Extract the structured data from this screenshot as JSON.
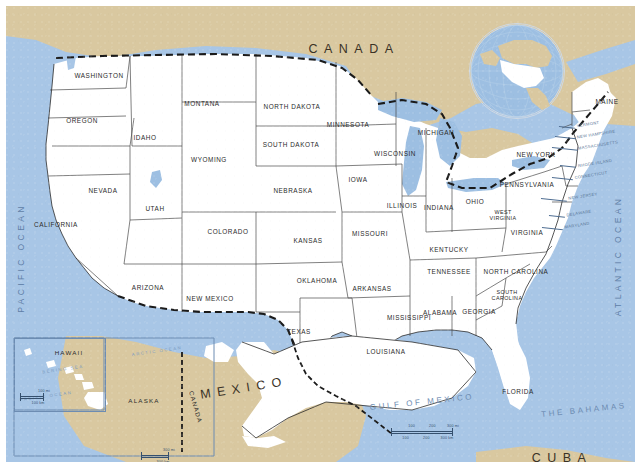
{
  "map": {
    "title": "United States of America reference map",
    "projection_note": "conterminous US with Alaska and Hawaii insets",
    "colors": {
      "ocean": "#a8c6e6",
      "foreign_land": "#d9c8a0",
      "us_land": "#ffffff",
      "state_border": "#4a4a4a",
      "international_border": "#1a1a1a",
      "lake": "#9dbfe2",
      "label": "#2a2a2a",
      "water_label": "#5f7ea6"
    }
  },
  "countries": [
    {
      "name": "CANADA",
      "x": 348,
      "y": 43
    },
    {
      "name": "MEXICO",
      "x": 238,
      "y": 382
    },
    {
      "name": "CUBA",
      "x": 556,
      "y": 452
    }
  ],
  "water_labels": [
    {
      "name": "PACIFIC OCEAN",
      "x": 15,
      "y": 252,
      "rotate": -90
    },
    {
      "name": "ATLANTIC OCEAN",
      "x": 612,
      "y": 250,
      "rotate": -90
    },
    {
      "name": "GULF OF MEXICO",
      "x": 416,
      "y": 396
    },
    {
      "name": "THE BAHAMAS",
      "x": 578,
      "y": 404
    }
  ],
  "states": [
    {
      "name": "WASHINGTON",
      "x": 93,
      "y": 69
    },
    {
      "name": "OREGON",
      "x": 76,
      "y": 114
    },
    {
      "name": "IDAHO",
      "x": 139,
      "y": 131
    },
    {
      "name": "MONTANA",
      "x": 196,
      "y": 97
    },
    {
      "name": "WYOMING",
      "x": 203,
      "y": 153
    },
    {
      "name": "NORTH DAKOTA",
      "x": 286,
      "y": 100
    },
    {
      "name": "SOUTH DAKOTA",
      "x": 285,
      "y": 138
    },
    {
      "name": "NEBRASKA",
      "x": 287,
      "y": 184
    },
    {
      "name": "KANSAS",
      "x": 302,
      "y": 234
    },
    {
      "name": "NEVADA",
      "x": 97,
      "y": 184
    },
    {
      "name": "UTAH",
      "x": 149,
      "y": 202
    },
    {
      "name": "COLORADO",
      "x": 222,
      "y": 225
    },
    {
      "name": "CALIFORNIA",
      "x": 50,
      "y": 218
    },
    {
      "name": "ARIZONA",
      "x": 142,
      "y": 281
    },
    {
      "name": "NEW MEXICO",
      "x": 204,
      "y": 292
    },
    {
      "name": "TEXAS",
      "x": 293,
      "y": 325
    },
    {
      "name": "OKLAHOMA",
      "x": 311,
      "y": 274
    },
    {
      "name": "MINNESOTA",
      "x": 342,
      "y": 118
    },
    {
      "name": "IOWA",
      "x": 352,
      "y": 173
    },
    {
      "name": "MISSOURI",
      "x": 364,
      "y": 227
    },
    {
      "name": "ARKANSAS",
      "x": 366,
      "y": 282
    },
    {
      "name": "LOUISIANA",
      "x": 380,
      "y": 345
    },
    {
      "name": "WISCONSIN",
      "x": 389,
      "y": 147
    },
    {
      "name": "ILLINOIS",
      "x": 396,
      "y": 199
    },
    {
      "name": "MICHIGAN",
      "x": 430,
      "y": 126
    },
    {
      "name": "INDIANA",
      "x": 433,
      "y": 201
    },
    {
      "name": "OHIO",
      "x": 469,
      "y": 195
    },
    {
      "name": "KENTUCKY",
      "x": 443,
      "y": 243
    },
    {
      "name": "TENNESSEE",
      "x": 443,
      "y": 265
    },
    {
      "name": "MISSISSIPPI",
      "x": 403,
      "y": 311
    },
    {
      "name": "ALABAMA",
      "x": 434,
      "y": 306
    },
    {
      "name": "GEORGIA",
      "x": 473,
      "y": 305
    },
    {
      "name": "FLORIDA",
      "x": 512,
      "y": 385
    },
    {
      "name": "NORTH CAROLINA",
      "x": 510,
      "y": 265
    },
    {
      "name": "PENNSYLVANIA",
      "x": 521,
      "y": 178
    },
    {
      "name": "NEW YORK",
      "x": 530,
      "y": 148
    },
    {
      "name": "VIRGINIA",
      "x": 521,
      "y": 226
    },
    {
      "name": "MAINE",
      "x": 601,
      "y": 95
    }
  ],
  "states_two_line": [
    {
      "line1": "WEST",
      "line2": "VIRGINIA",
      "x": 497,
      "y": 209
    },
    {
      "line1": "SOUTH",
      "line2": "CAROLINA",
      "x": 501,
      "y": 289
    }
  ],
  "small_states": [
    {
      "name": "VERMONT",
      "x": 582,
      "y": 118
    },
    {
      "name": "NEW HAMPSHIRE",
      "x": 590,
      "y": 128
    },
    {
      "name": "MASSACHUSETTS",
      "x": 592,
      "y": 139
    },
    {
      "name": "RHODE ISLAND",
      "x": 589,
      "y": 157
    },
    {
      "name": "CONNECTICUT",
      "x": 585,
      "y": 169
    },
    {
      "name": "NEW JERSEY",
      "x": 577,
      "y": 190
    },
    {
      "name": "DELAWARE",
      "x": 573,
      "y": 207
    },
    {
      "name": "MARYLAND",
      "x": 571,
      "y": 219
    }
  ],
  "insets": [
    {
      "name": "HAWAII",
      "label_x": 63,
      "label_y": 346
    },
    {
      "name": "ALASKA",
      "label_x": 138,
      "label_y": 394
    },
    {
      "name": "CANADA",
      "label_x": 190,
      "label_y": 401
    }
  ],
  "inset_water": [
    {
      "name": "ARCTIC OCEAN",
      "x": 151,
      "y": 345
    },
    {
      "name": "PACIFIC OCEAN",
      "x": 40,
      "y": 390
    },
    {
      "name": "BERING SEA",
      "x": 57,
      "y": 363
    }
  ],
  "scalebars": [
    {
      "id": "main-scalebar",
      "x": 385,
      "y": 420,
      "width": 62,
      "miles_labels": [
        "100",
        "200",
        "300 mi"
      ],
      "km_labels": [
        "100",
        "200",
        "300 km"
      ]
    },
    {
      "id": "alaska-scalebar",
      "x": 135,
      "y": 444,
      "width": 28,
      "miles_labels": [
        "300 mi"
      ],
      "km_labels": [
        "300 km"
      ]
    },
    {
      "id": "hawaii-scalebar",
      "x": 14,
      "y": 385,
      "width": 24,
      "miles_labels": [
        "100 mi"
      ],
      "km_labels": [
        "100 km"
      ]
    }
  ],
  "globe_inset": {
    "name": "locator-globe",
    "cx": 510,
    "cy": 64,
    "r": 47,
    "description": "orthographic globe locator centered on North America with United States highlighted"
  }
}
